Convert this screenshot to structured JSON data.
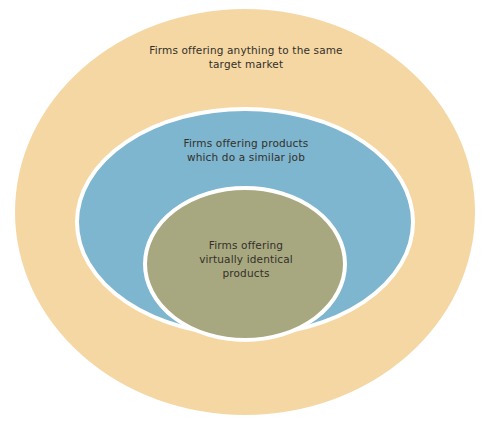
{
  "diagram": {
    "type": "nested-ellipse-venn",
    "background_color": "#ffffff",
    "ring_stroke_color": "#ffffff",
    "text_color": "#333029",
    "rings": [
      {
        "id": "outer",
        "name": "broadest-competition-ring",
        "label": "Firms offering anything to the same\ntarget market",
        "label_lines": [
          "Firms offering anything to the same",
          "target market"
        ],
        "fill_color": "#f5d7a4",
        "cx": 245,
        "cy": 212,
        "rx": 230,
        "ry": 203
      },
      {
        "id": "middle",
        "name": "similar-job-competition-ring",
        "label": "Firms offering products\nwhich do a similar job",
        "label_lines": [
          "Firms offering products",
          "which do a similar job"
        ],
        "fill_color": "#7eb5cf",
        "cx": 245,
        "cy": 222,
        "rx": 168,
        "ry": 113
      },
      {
        "id": "inner",
        "name": "identical-products-competition-ring",
        "label": "Firms offering\nvirtually identical\nproducts",
        "label_lines": [
          "Firms offering",
          "virtually identical",
          "products"
        ],
        "fill_color": "#a8a880",
        "cx": 245,
        "cy": 264,
        "rx": 100,
        "ry": 76
      }
    ]
  }
}
